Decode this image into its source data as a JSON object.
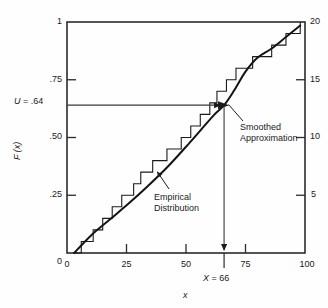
{
  "chart_data": {
    "type": "line",
    "title": "",
    "xlabel": "x",
    "ylabel": "F (x)",
    "xlim": [
      0,
      100
    ],
    "ylim": [
      0,
      1
    ],
    "y2lim": [
      0,
      20
    ],
    "grid": false,
    "legend_position": "inline-annotations",
    "x_ticks": [
      {
        "value": 0,
        "label": "0"
      },
      {
        "value": 25,
        "label": "25"
      },
      {
        "value": 50,
        "label": "50"
      },
      {
        "value": 75,
        "label": "75"
      },
      {
        "value": 100,
        "label": "100"
      }
    ],
    "y_ticks": [
      {
        "value": 0,
        "label": "0"
      },
      {
        "value": 0.25,
        "label": ".25"
      },
      {
        "value": 0.5,
        "label": ".50"
      },
      {
        "value": 0.75,
        "label": ".75"
      },
      {
        "value": 1,
        "label": "1"
      }
    ],
    "y2_ticks": [
      {
        "value": 5,
        "label": "5"
      },
      {
        "value": 10,
        "label": "10"
      },
      {
        "value": 15,
        "label": "15"
      },
      {
        "value": 20,
        "label": "20"
      }
    ],
    "series": [
      {
        "name": "Empirical Distribution",
        "type": "step",
        "note": "Empirical CDF staircase of 20 ordered observations; each step rises 1/20 = .05",
        "points_x": [
          3,
          6,
          11,
          15,
          19,
          23,
          28,
          31,
          36,
          42,
          48,
          52,
          56,
          60,
          63,
          67,
          71,
          78,
          86,
          92,
          98
        ],
        "points_y": [
          0.0,
          0.05,
          0.1,
          0.15,
          0.2,
          0.25,
          0.3,
          0.35,
          0.4,
          0.45,
          0.5,
          0.55,
          0.6,
          0.65,
          0.7,
          0.75,
          0.8,
          0.85,
          0.9,
          0.95,
          1.0
        ]
      },
      {
        "name": "Smoothed Approximation",
        "type": "line",
        "note": "Smooth monotone curve fitted through the empirical CDF",
        "points_x": [
          3,
          10,
          18,
          26,
          34,
          42,
          50,
          56,
          62,
          66,
          70,
          75,
          80,
          86,
          92,
          98
        ],
        "points_y": [
          0.0,
          0.075,
          0.145,
          0.215,
          0.29,
          0.37,
          0.46,
          0.53,
          0.6,
          0.64,
          0.7,
          0.785,
          0.845,
          0.885,
          0.935,
          0.985
        ]
      }
    ],
    "annotations": [
      {
        "name": "u-value",
        "text": "U = .64",
        "value": 0.64,
        "axis": "y"
      },
      {
        "name": "x-solution",
        "text": "X = 66",
        "value": 66,
        "axis": "x"
      },
      {
        "name": "empirical-distribution",
        "text": "Empirical Distribution"
      },
      {
        "name": "smoothed-approximation",
        "text": "Smoothed Approximation"
      }
    ]
  },
  "axes": {
    "left_labels": [
      "1",
      ".75",
      ".50",
      ".25",
      "0"
    ],
    "right_labels": [
      "20",
      "15",
      "10",
      "5"
    ],
    "bottom_labels": [
      "0",
      "25",
      "50",
      "75",
      "100"
    ],
    "y_title": "F (x)",
    "x_title": "x"
  },
  "callouts": {
    "u_prefix": "U",
    "u_equals": " = .64",
    "x_prefix": "X",
    "x_equals": " = 66",
    "empirical_line1": "Empirical",
    "empirical_line2": "Distribution",
    "smoothed_line1": "Smoothed",
    "smoothed_line2": "Approximation"
  },
  "colors": {
    "background": "#fefefe",
    "ink": "#1a1a1a",
    "frame": "#2b2b2b",
    "guide": "#4a4a4a"
  }
}
